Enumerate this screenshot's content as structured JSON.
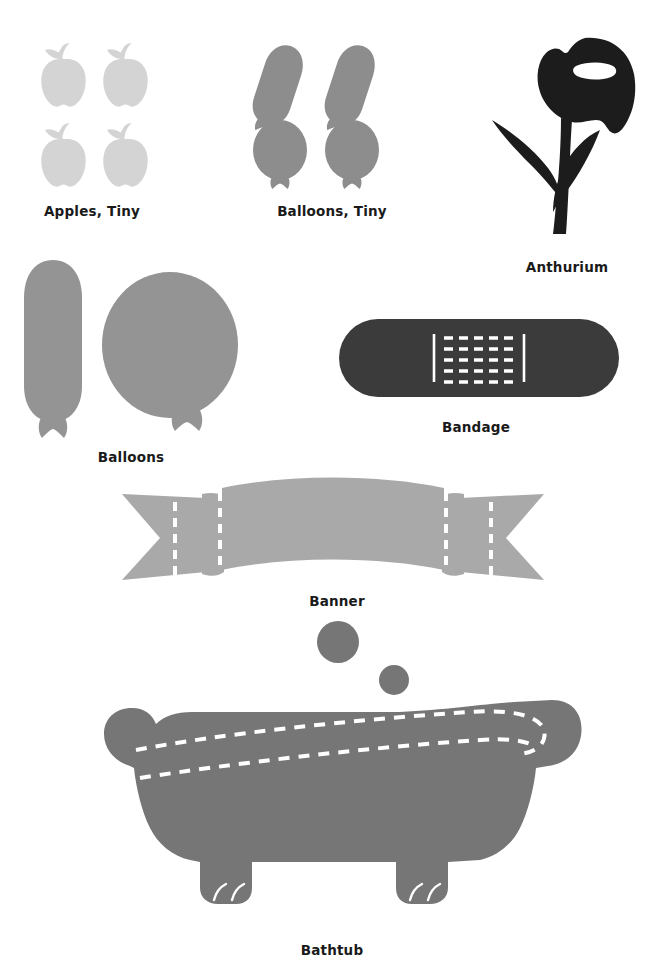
{
  "page": {
    "background_color": "#ffffff",
    "width": 657,
    "height": 969,
    "text_color": "#1a1a1a"
  },
  "palette": {
    "apple_gray": "#d4d4d4",
    "balloon_gray": "#8d8d8d",
    "balloon_light_gray": "#949494",
    "anthurium_black": "#1c1c1c",
    "bandage_dark": "#3b3b3b",
    "banner_gray": "#a9a9a9",
    "bathtub_gray": "#767676",
    "dash_white": "#ffffff"
  },
  "items": [
    {
      "id": "apples-tiny",
      "label": "Apples, Tiny",
      "icon": "apple-icon",
      "count": 4,
      "color": "#d4d4d4",
      "caption_x": 92,
      "caption_y": 203
    },
    {
      "id": "balloons-tiny",
      "label": "Balloons, Tiny",
      "icon": "balloon-icon",
      "count": 4,
      "color": "#8d8d8d",
      "caption_x": 332,
      "caption_y": 203
    },
    {
      "id": "anthurium",
      "label": "Anthurium",
      "icon": "flower-icon",
      "count": 1,
      "color": "#1c1c1c",
      "caption_x": 567,
      "caption_y": 259
    },
    {
      "id": "balloons",
      "label": "Balloons",
      "icon": "balloon-icon",
      "count": 2,
      "color": "#949494",
      "caption_x": 131,
      "caption_y": 449
    },
    {
      "id": "bandage",
      "label": "Bandage",
      "icon": "bandage-icon",
      "count": 1,
      "color": "#3b3b3b",
      "caption_x": 476,
      "caption_y": 419
    },
    {
      "id": "banner",
      "label": "Banner",
      "icon": "banner-icon",
      "count": 1,
      "color": "#a9a9a9",
      "caption_x": 337,
      "caption_y": 593
    },
    {
      "id": "bathtub",
      "label": "Bathtub",
      "icon": "bathtub-icon",
      "count": 1,
      "color": "#767676",
      "caption_x": 332,
      "caption_y": 942,
      "extras": [
        "bubble-large",
        "bubble-small"
      ]
    }
  ]
}
